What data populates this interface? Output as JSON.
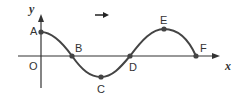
{
  "diagram": {
    "type": "wave-graph",
    "axes": {
      "x_label": "x",
      "y_label": "y",
      "origin_label": "O"
    },
    "direction_arrow": "→",
    "points": [
      {
        "label": "A",
        "x": 41,
        "y": 32
      },
      {
        "label": "B",
        "x": 72,
        "y": 56
      },
      {
        "label": "C",
        "x": 101,
        "y": 77
      },
      {
        "label": "D",
        "x": 130,
        "y": 56
      },
      {
        "label": "E",
        "x": 164,
        "y": 29
      },
      {
        "label": "F",
        "x": 196,
        "y": 56
      }
    ],
    "colors": {
      "curve": "#444444",
      "axis": "#333333",
      "point": "#444444"
    }
  }
}
